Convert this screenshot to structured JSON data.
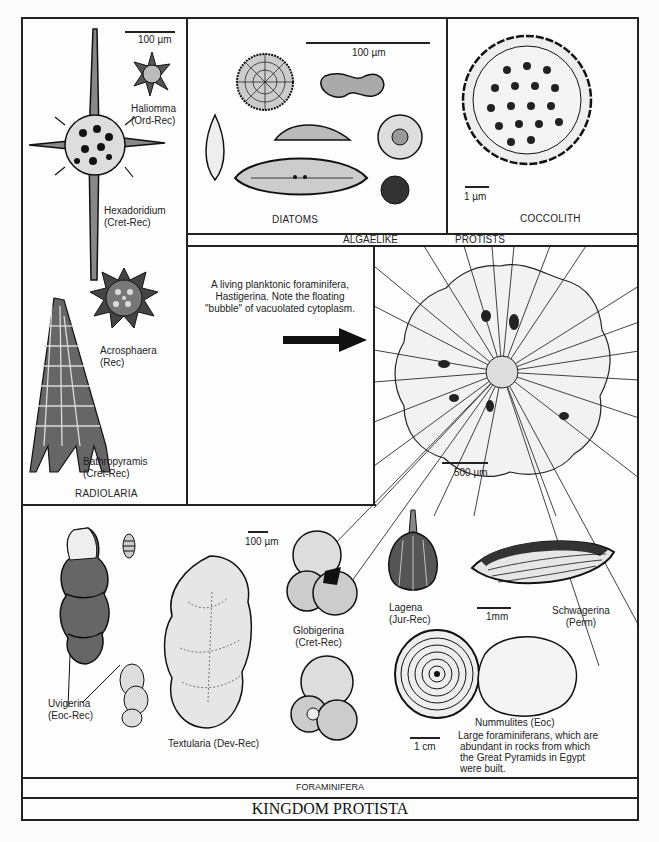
{
  "figure": {
    "title": "KINGDOM PROTISTA",
    "bands": {
      "algaelike": "ALGAELIKE",
      "protists": "PROTISTS",
      "foraminifera": "FORAMINIFERA"
    },
    "radiolaria": {
      "section_label": "RADIOLARIA",
      "scale": "100 µm",
      "specimens": [
        {
          "name": "Haliomma",
          "range": "(Ord-Rec)"
        },
        {
          "name": "Hexadoridium",
          "range": "(Cret-Rec)"
        },
        {
          "name": "Acrosphaera",
          "range": "(Rec)"
        },
        {
          "name": "Bathropyramis",
          "range": "(Cret-Rec)"
        }
      ]
    },
    "diatoms": {
      "section_label": "DIATOMS",
      "scale": "100 µm"
    },
    "coccolith": {
      "section_label": "COCCOLITH",
      "scale": "1 µm"
    },
    "hastigerina": {
      "caption_lines": [
        "A living planktonic foraminifera,",
        "Hastigerina. Note the floating",
        "\"bubble\" of vacuolated cytoplasm."
      ],
      "scale": "500 µm"
    },
    "foraminifera": {
      "scale_small": "100 µm",
      "specimens": [
        {
          "name": "Uvigerina",
          "range": "(Eoc-Rec)"
        },
        {
          "name": "Textularia (Dev-Rec)",
          "range": ""
        },
        {
          "name": "Globigerina",
          "range": "(Cret-Rec)"
        },
        {
          "name": "Lagena",
          "range": "(Jur-Rec)"
        },
        {
          "name": "Schwagerina",
          "range": "(Perm)"
        },
        {
          "name": "Nummulites (Eoc)",
          "range": ""
        }
      ],
      "scale_schwagerina": "1mm",
      "scale_nummulites": "1 cm",
      "nummulites_note_lines": [
        "Large foraminiferans, which are",
        "abundant in rocks from which",
        "the Great Pyramids in Egypt",
        "were built."
      ]
    }
  }
}
